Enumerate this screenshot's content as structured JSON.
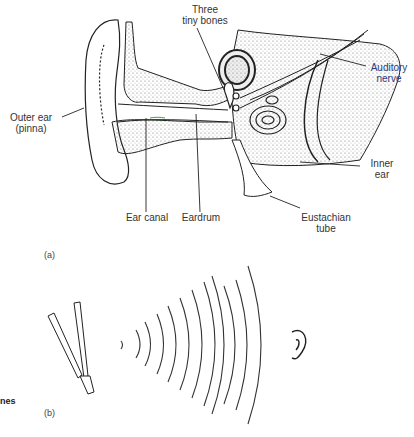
{
  "panel_a": {
    "caption": "(a)",
    "labels": {
      "three_tiny_bones": [
        "Three",
        "tiny bones"
      ],
      "outer_ear": [
        "Outer ear",
        "(pinna)"
      ],
      "auditory_nerve": [
        "Auditory",
        "nerve"
      ],
      "inner_ear": [
        "Inner",
        "ear"
      ],
      "ear_canal": "Ear canal",
      "eardrum": "Eardrum",
      "eustachian_tube": [
        "Eustachian",
        "tube"
      ]
    }
  },
  "panel_b": {
    "caption": "(b)",
    "elements": [
      "tuning-fork",
      "sound-waves",
      "ear"
    ]
  },
  "edge_fragment": "nes"
}
